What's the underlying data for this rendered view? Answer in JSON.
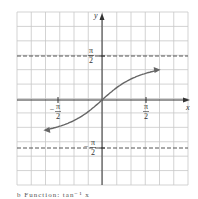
{
  "chart_data": {
    "type": "line",
    "title": "",
    "function": "y = arctan(x)",
    "xlabel": "x",
    "ylabel": "y",
    "x_ticks": [
      {
        "value": -1.5708,
        "label": "-π/2"
      },
      {
        "value": 1.5708,
        "label": "π/2"
      }
    ],
    "y_ticks": [
      {
        "value": 1.5708,
        "label": "π/2"
      },
      {
        "value": -1.5708,
        "label": "-π/2"
      }
    ],
    "asymptotes": [
      {
        "y": 1.5708,
        "style": "dashed",
        "label": "π/2"
      },
      {
        "y": -1.5708,
        "style": "dashed",
        "label": "-π/2"
      }
    ],
    "series": [
      {
        "name": "arctan",
        "x": [
          -3,
          -2,
          -1.5,
          -1,
          -0.5,
          0,
          0.5,
          1,
          1.5,
          2,
          3
        ],
        "values": [
          -1.249,
          -1.107,
          -0.983,
          -0.785,
          -0.464,
          0,
          0.464,
          0.785,
          0.983,
          1.107,
          1.249
        ]
      }
    ],
    "xlim": [
      -3.4,
      3.4
    ],
    "ylim": [
      -3.0,
      2.5
    ],
    "grid": true,
    "grid_cells": {
      "columns": 12,
      "rows": 12
    },
    "legend": "none"
  },
  "labels": {
    "x_axis": "x",
    "y_axis": "y",
    "pi_num": "π",
    "den": "2",
    "minus": "−"
  },
  "caption": "b  Function: tan⁻¹ x"
}
